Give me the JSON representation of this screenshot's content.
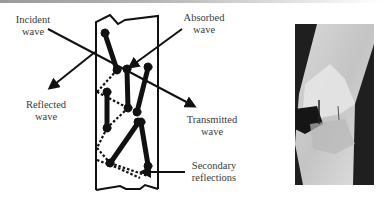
{
  "figure": {
    "labels": {
      "incident": "Incident\nwave",
      "absorbed": "Absorbed\nwave",
      "reflected": "Reflected\nwave",
      "transmitted": "Transmitted\nwave",
      "secondary": "Secondary\nreflections"
    },
    "photo": {
      "description": "Photograph of a fractured laminated specimen with pins"
    },
    "colors": {
      "ink": "#111111",
      "text": "#3a3a3a",
      "background": "#ffffff"
    }
  }
}
